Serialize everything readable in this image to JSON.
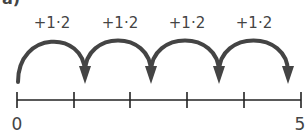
{
  "part_label": "a)",
  "number_line": {
    "start_label": "0",
    "end_label": "5",
    "tick_count": 6,
    "color": "#222222"
  },
  "jumps": [
    {
      "label": "+1·2"
    },
    {
      "label": "+1·2"
    },
    {
      "label": "+1·2"
    },
    {
      "label": "+1·2"
    }
  ],
  "arc_color": "#444444"
}
